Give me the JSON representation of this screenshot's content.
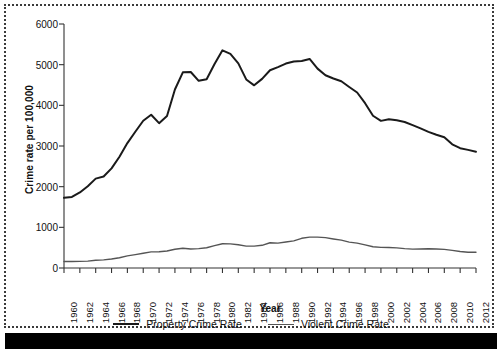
{
  "chart_data": {
    "type": "line",
    "title": "",
    "xlabel": "Year",
    "ylabel": "Crime rate per 100,000",
    "xlim": [
      1960,
      2012
    ],
    "ylim": [
      0,
      6000
    ],
    "grid": false,
    "legend_position": "bottom",
    "yticks": [
      0,
      1000,
      2000,
      3000,
      4000,
      5000,
      6000
    ],
    "ytick_labels": [
      "0",
      "1000",
      "2000",
      "3000",
      "4000",
      "5000",
      "6000"
    ],
    "xticks": [
      1960,
      1962,
      1964,
      1966,
      1968,
      1970,
      1972,
      1974,
      1976,
      1978,
      1980,
      1982,
      1984,
      1986,
      1988,
      1990,
      1992,
      1994,
      1996,
      1998,
      2000,
      2002,
      2004,
      2006,
      2008,
      2010,
      2012
    ],
    "xtick_labels": [
      "1960",
      "1962",
      "1964",
      "1966",
      "1968",
      "1970",
      "1972",
      "1974",
      "1976",
      "1978",
      "1980",
      "1982",
      "1984",
      "1986",
      "1988",
      "1990",
      "1992",
      "1994",
      "1996",
      "1998",
      "2000",
      "2002",
      "2004",
      "2006",
      "2008",
      "2010",
      "2012"
    ],
    "x": [
      1960,
      1961,
      1962,
      1963,
      1964,
      1965,
      1966,
      1967,
      1968,
      1969,
      1970,
      1971,
      1972,
      1973,
      1974,
      1975,
      1976,
      1977,
      1978,
      1979,
      1980,
      1981,
      1982,
      1983,
      1984,
      1985,
      1986,
      1987,
      1988,
      1989,
      1990,
      1991,
      1992,
      1993,
      1994,
      1995,
      1996,
      1997,
      1998,
      1999,
      2000,
      2001,
      2002,
      2003,
      2004,
      2005,
      2006,
      2007,
      2008,
      2009,
      2010,
      2011,
      2012
    ],
    "series": [
      {
        "name": "Property Crime Rate",
        "color": "#1a1a1a",
        "width": 2.0,
        "values": [
          1726,
          1747,
          1857,
          2012,
          2198,
          2249,
          2451,
          2737,
          3071,
          3351,
          3621,
          3769,
          3561,
          3737,
          4389,
          4811,
          4820,
          4602,
          4643,
          5017,
          5353,
          5264,
          5033,
          4637,
          4492,
          4651,
          4863,
          4940,
          5027,
          5078,
          5089,
          5140,
          4903,
          4740,
          4660,
          4591,
          4451,
          4316,
          4053,
          3744,
          3618,
          3658,
          3631,
          3591,
          3514,
          3432,
          3347,
          3276,
          3215,
          3041,
          2946,
          2905,
          2859
        ]
      },
      {
        "name": "Violent Crime Rate",
        "color": "#555555",
        "width": 1.4,
        "values": [
          161,
          158,
          162,
          168,
          191,
          200,
          220,
          253,
          298,
          329,
          364,
          396,
          401,
          417,
          461,
          487,
          468,
          476,
          498,
          549,
          597,
          594,
          571,
          538,
          539,
          558,
          620,
          612,
          640,
          666,
          730,
          758,
          758,
          747,
          714,
          685,
          637,
          611,
          568,
          523,
          507,
          505,
          494,
          476,
          463,
          469,
          474,
          467,
          458,
          432,
          405,
          387,
          387
        ]
      }
    ]
  },
  "legend": {
    "items": [
      {
        "label": "Property Crime Rate",
        "color": "#1a1a1a",
        "width": "2px"
      },
      {
        "label": "Violent Crime Rate",
        "color": "#555555",
        "width": "1.5px"
      }
    ]
  }
}
